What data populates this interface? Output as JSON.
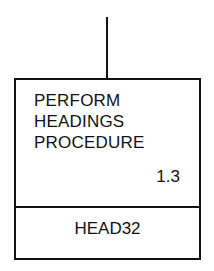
{
  "diagram": {
    "type": "structure-chart-module",
    "module": {
      "title_lines": [
        "PERFORM",
        "HEADINGS",
        "PROCEDURE"
      ],
      "number": "1.3",
      "code": "HEAD32"
    },
    "connector": "incoming line from parent (top)"
  }
}
